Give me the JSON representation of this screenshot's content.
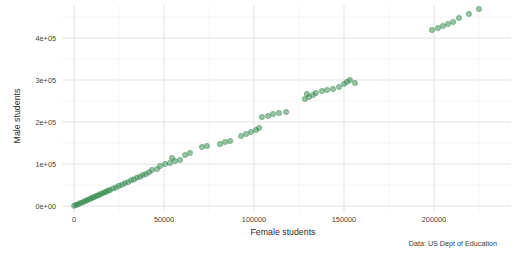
{
  "chart_data": {
    "type": "scatter",
    "title": "",
    "xlabel": "Female students",
    "ylabel": "Male students",
    "caption": "Data: US Dept of Education",
    "legend": false,
    "grid": true,
    "xlim": [
      -6700,
      242800
    ],
    "ylim": [
      -14300,
      478600
    ],
    "x_ticks": {
      "values": [
        0,
        50000,
        100000,
        150000,
        200000
      ],
      "labels": [
        "0",
        "50000",
        "100000",
        "150000",
        "200000"
      ]
    },
    "x_minor": [
      25000,
      75000,
      125000,
      175000,
      225000
    ],
    "y_ticks": {
      "values": [
        0,
        100000,
        200000,
        300000,
        400000
      ],
      "labels": [
        "0e+00",
        "1e+05",
        "2e+05",
        "3e+05",
        "4e+05"
      ]
    },
    "y_minor": [
      50000,
      150000,
      250000,
      350000,
      450000
    ],
    "colors": {
      "point": "#2c8448",
      "point_opacity": 0.5,
      "grid_major": "#e3e3e3",
      "grid_minor": "#f1f1f1",
      "background": "#ffffff",
      "text": "#444444"
    },
    "series_name": "Enrollment by institution (female vs male students)",
    "points": [
      [
        0,
        400
      ],
      [
        1100,
        2300
      ],
      [
        2200,
        4100
      ],
      [
        3300,
        6600
      ],
      [
        4400,
        8100
      ],
      [
        5600,
        10900
      ],
      [
        6700,
        12600
      ],
      [
        7800,
        15200
      ],
      [
        8900,
        16800
      ],
      [
        10000,
        19600
      ],
      [
        11100,
        21000
      ],
      [
        12200,
        23800
      ],
      [
        13300,
        25100
      ],
      [
        14400,
        27900
      ],
      [
        15600,
        29500
      ],
      [
        16700,
        32400
      ],
      [
        17800,
        33700
      ],
      [
        18900,
        36600
      ],
      [
        20000,
        38000
      ],
      [
        21700,
        41900
      ],
      [
        23300,
        44300
      ],
      [
        25000,
        48400
      ],
      [
        26700,
        50700
      ],
      [
        28300,
        54600
      ],
      [
        30000,
        57000
      ],
      [
        31700,
        61200
      ],
      [
        33300,
        63300
      ],
      [
        35000,
        67600
      ],
      [
        36700,
        69800
      ],
      [
        38300,
        74000
      ],
      [
        40000,
        76100
      ],
      [
        41700,
        80300
      ],
      [
        43300,
        85700
      ],
      [
        46100,
        88100
      ],
      [
        47800,
        95200
      ],
      [
        50600,
        100000
      ],
      [
        53300,
        102400
      ],
      [
        56100,
        107100
      ],
      [
        58900,
        109500
      ],
      [
        54400,
        114300
      ],
      [
        61700,
        121400
      ],
      [
        64400,
        126200
      ],
      [
        71100,
        140500
      ],
      [
        73900,
        142900
      ],
      [
        81100,
        147600
      ],
      [
        83900,
        152400
      ],
      [
        86700,
        154800
      ],
      [
        92800,
        166700
      ],
      [
        95600,
        171400
      ],
      [
        98300,
        176200
      ],
      [
        101100,
        181000
      ],
      [
        102800,
        185700
      ],
      [
        104400,
        211900
      ],
      [
        107800,
        214300
      ],
      [
        110600,
        219000
      ],
      [
        113900,
        221400
      ],
      [
        117800,
        223800
      ],
      [
        128300,
        254800
      ],
      [
        130600,
        259500
      ],
      [
        132800,
        264300
      ],
      [
        129400,
        266700
      ],
      [
        134400,
        269000
      ],
      [
        137800,
        273800
      ],
      [
        140600,
        276200
      ],
      [
        143900,
        278600
      ],
      [
        147200,
        283300
      ],
      [
        150000,
        290500
      ],
      [
        151700,
        295200
      ],
      [
        153300,
        300000
      ],
      [
        156100,
        292900
      ],
      [
        198900,
        419000
      ],
      [
        202200,
        423800
      ],
      [
        205000,
        428600
      ],
      [
        207800,
        433300
      ],
      [
        210600,
        438100
      ],
      [
        213900,
        447600
      ],
      [
        219400,
        457100
      ],
      [
        225000,
        469000
      ]
    ]
  }
}
